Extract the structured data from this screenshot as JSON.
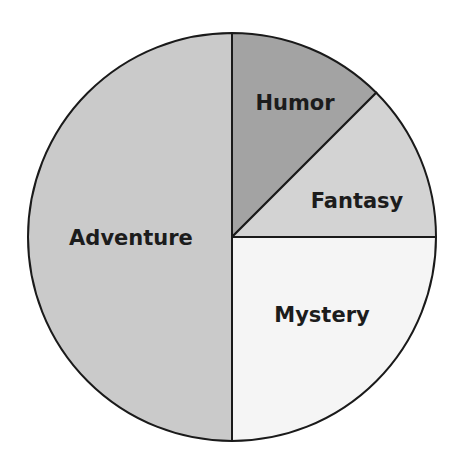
{
  "chart_data": {
    "type": "pie",
    "title": "",
    "start_angle_deg": 0,
    "direction": "clockwise",
    "center": [
      232,
      237
    ],
    "radius": 204,
    "stroke_color": "#1a1a1a",
    "stroke_width": 2,
    "slices": [
      {
        "label": "Humor",
        "value": 12.5,
        "color": "#a3a3a3",
        "label_pos": [
          295,
          110
        ]
      },
      {
        "label": "Fantasy",
        "value": 12.5,
        "color": "#d3d3d3",
        "label_pos": [
          357,
          208
        ]
      },
      {
        "label": "Mystery",
        "value": 25,
        "color": "#f5f5f5",
        "label_pos": [
          322,
          322
        ]
      },
      {
        "label": "Adventure",
        "value": 50,
        "color": "#cacaca",
        "label_pos": [
          131,
          245
        ]
      }
    ],
    "legend": "none",
    "labels_inside": true
  }
}
